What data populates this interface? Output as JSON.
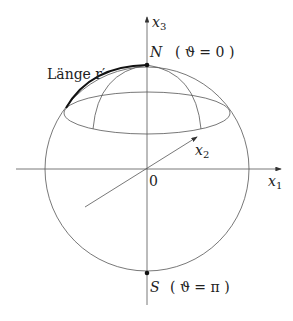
{
  "diagram": {
    "axes": {
      "x1": {
        "label": "x",
        "sub": "1"
      },
      "x2": {
        "label": "x",
        "sub": "2"
      },
      "x3": {
        "label": "x",
        "sub": "3"
      }
    },
    "origin_label": "0",
    "north": {
      "label": "N",
      "annotation": "( ϑ = 0 )"
    },
    "south": {
      "label": "S",
      "annotation": "( ϑ = π )"
    },
    "arc_label": "Länge r′",
    "colors": {
      "line": "#333333",
      "arc": "#111111"
    }
  }
}
